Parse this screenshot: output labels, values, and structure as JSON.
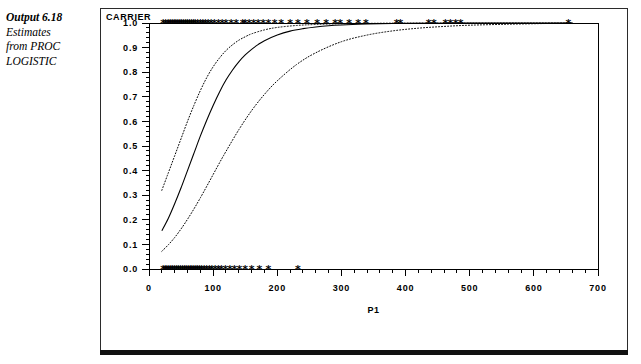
{
  "caption": {
    "title": "Output 6.18",
    "lines": [
      "Estimates",
      "from PROC",
      "LOGISTIC"
    ]
  },
  "chart_data": {
    "type": "line",
    "title": "",
    "xlabel": "P1",
    "ylabel": "CARRIER",
    "xlim": [
      0,
      700
    ],
    "ylim": [
      0.0,
      1.0
    ],
    "grid": false,
    "legend_position": "none",
    "xticks": [
      0,
      100,
      200,
      300,
      400,
      500,
      600,
      700
    ],
    "xtick_labels": [
      "0",
      "100",
      "200",
      "300",
      "400",
      "500",
      "600",
      "700"
    ],
    "yticks": [
      0.0,
      0.1,
      0.2,
      0.3,
      0.4,
      0.5,
      0.6,
      0.7,
      0.8,
      0.9,
      1.0
    ],
    "ytick_labels": [
      "0.0",
      "0.1",
      "0.2",
      "0.3",
      "0.4",
      "0.5",
      "0.6",
      "0.7",
      "0.8",
      "0.9",
      "1.0"
    ],
    "x_minor_tick_step": 20,
    "y_minor_tick_step": 0.02,
    "series": [
      {
        "name": "Predicted probability",
        "style": "solid",
        "x": [
          20,
          30,
          40,
          50,
          60,
          70,
          80,
          90,
          100,
          110,
          120,
          130,
          140,
          150,
          160,
          170,
          180,
          200,
          220,
          240,
          260,
          280,
          300,
          340,
          380,
          420,
          460,
          500,
          560,
          620,
          660
        ],
        "values": [
          0.155,
          0.205,
          0.265,
          0.33,
          0.4,
          0.47,
          0.54,
          0.605,
          0.665,
          0.72,
          0.768,
          0.808,
          0.842,
          0.87,
          0.893,
          0.912,
          0.928,
          0.951,
          0.967,
          0.977,
          0.984,
          0.989,
          0.992,
          0.996,
          0.998,
          0.999,
          0.999,
          1.0,
          1.0,
          1.0,
          1.0
        ]
      },
      {
        "name": "Upper confidence limit",
        "style": "dotted",
        "x": [
          20,
          30,
          40,
          50,
          60,
          70,
          80,
          90,
          100,
          110,
          120,
          130,
          140,
          150,
          160,
          180,
          200,
          230,
          260,
          300,
          360,
          420,
          500,
          600,
          660
        ],
        "values": [
          0.32,
          0.39,
          0.46,
          0.53,
          0.6,
          0.665,
          0.725,
          0.778,
          0.822,
          0.858,
          0.888,
          0.911,
          0.93,
          0.944,
          0.956,
          0.972,
          0.982,
          0.99,
          0.994,
          0.997,
          0.999,
          1.0,
          1.0,
          1.0,
          1.0
        ]
      },
      {
        "name": "Lower confidence limit",
        "style": "dotted",
        "x": [
          20,
          30,
          40,
          50,
          60,
          70,
          80,
          90,
          100,
          110,
          120,
          140,
          160,
          180,
          200,
          230,
          260,
          300,
          340,
          380,
          420,
          460,
          500,
          560,
          620,
          660
        ],
        "values": [
          0.072,
          0.098,
          0.128,
          0.163,
          0.202,
          0.244,
          0.289,
          0.336,
          0.384,
          0.432,
          0.478,
          0.566,
          0.644,
          0.71,
          0.765,
          0.831,
          0.879,
          0.924,
          0.951,
          0.968,
          0.979,
          0.986,
          0.991,
          0.995,
          0.998,
          0.999
        ]
      }
    ],
    "scatter_points": [
      {
        "name": "observed-carrier-positive",
        "symbol": "*",
        "y": 1.0,
        "x": [
          22,
          26,
          30,
          33,
          36,
          39,
          42,
          45,
          48,
          51,
          54,
          57,
          60,
          63,
          66,
          69,
          72,
          76,
          80,
          84,
          88,
          92,
          97,
          102,
          108,
          114,
          120,
          128,
          136,
          146,
          150,
          156,
          163,
          170,
          178,
          186,
          196,
          206,
          220,
          232,
          246,
          262,
          276,
          290,
          298,
          312,
          326,
          338,
          386,
          392,
          436,
          444,
          462,
          470,
          478,
          486,
          654
        ]
      },
      {
        "name": "observed-carrier-negative",
        "symbol": "*",
        "y": 0.0,
        "x": [
          22,
          25,
          28,
          31,
          34,
          37,
          40,
          43,
          46,
          49,
          52,
          55,
          58,
          61,
          64,
          67,
          70,
          73,
          76,
          79,
          82,
          86,
          90,
          94,
          98,
          103,
          108,
          113,
          119,
          126,
          133,
          141,
          150,
          160,
          172,
          186,
          232
        ]
      }
    ]
  }
}
